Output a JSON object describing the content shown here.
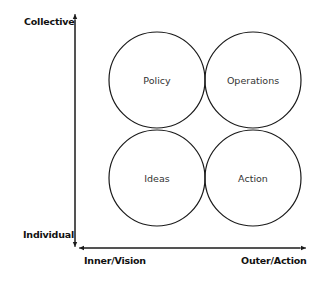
{
  "axes": {
    "y_top_label": "Collective",
    "y_bottom_label": "Individual",
    "x_left_label": "Inner/Vision",
    "x_right_label": "Outer/Action"
  },
  "quadrants": [
    {
      "label": "Policy",
      "position": "top-left"
    },
    {
      "label": "Operations",
      "position": "top-right"
    },
    {
      "label": "Ideas",
      "position": "bottom-left"
    },
    {
      "label": "Action",
      "position": "bottom-right"
    }
  ],
  "colors": {
    "stroke": "#1a1a1a",
    "text": "#333333",
    "background": "#ffffff"
  }
}
